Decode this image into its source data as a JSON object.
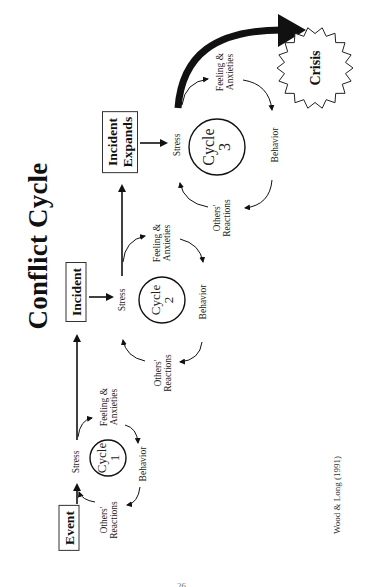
{
  "title": "Conflict Cycle",
  "boxes": {
    "event": "Event",
    "incident": "Incident",
    "incident_expands_line1": "Incident",
    "incident_expands_line2": "Expands",
    "crisis": "Crisis"
  },
  "cycles": [
    {
      "name": "Cycle",
      "number": "1",
      "stress": "Stress",
      "feeling_line1": "Feeling &",
      "feeling_line2": "Anxieties",
      "behavior": "Behavior",
      "others_line1": "Others'",
      "others_line2": "Reactions"
    },
    {
      "name": "Cycle",
      "number": "2",
      "stress": "Stress",
      "feeling_line1": "Feeling &",
      "feeling_line2": "Anxieties",
      "behavior": "Behavior",
      "others_line1": "Others'",
      "others_line2": "Reactions"
    },
    {
      "name": "Cycle",
      "number": "3",
      "stress": "Stress",
      "feeling_line1": "Feeling &",
      "feeling_line2": "Anxieties",
      "behavior": "Behavior",
      "others_line1": "Others'",
      "others_line2": "Reactions"
    }
  ],
  "citation": "Wood & Long (1991)",
  "page_number": "26",
  "colors": {
    "ink": "#111111",
    "background": "#ffffff"
  }
}
